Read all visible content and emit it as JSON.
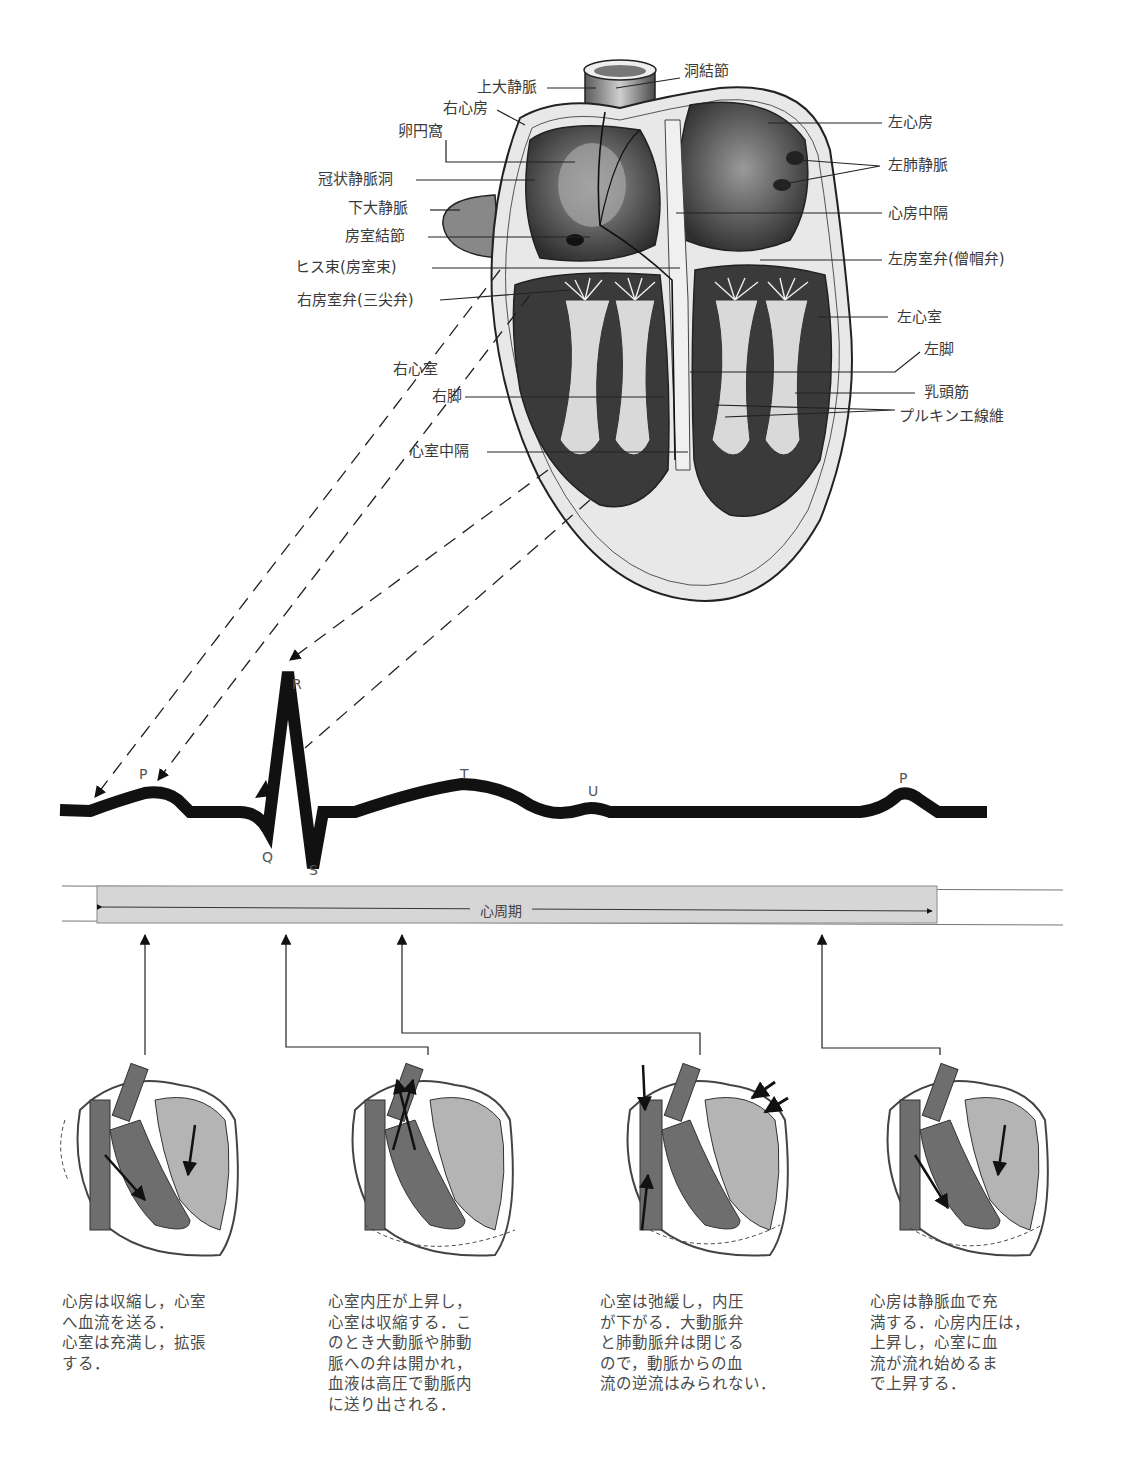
{
  "heart_diagram": {
    "labels_left": [
      {
        "id": "svc",
        "text": "上大静脈"
      },
      {
        "id": "ra",
        "text": "右心房"
      },
      {
        "id": "fossa",
        "text": "卵円窩"
      },
      {
        "id": "cs",
        "text": "冠状静脈洞"
      },
      {
        "id": "ivc",
        "text": "下大静脈"
      },
      {
        "id": "avn",
        "text": "房室結節"
      },
      {
        "id": "his",
        "text": "ヒス束(房室束)"
      },
      {
        "id": "tricuspid",
        "text": "右房室弁(三尖弁)"
      },
      {
        "id": "rv",
        "text": "右心室"
      },
      {
        "id": "rbb",
        "text": "右脚"
      },
      {
        "id": "ivs",
        "text": "心室中隔"
      }
    ],
    "labels_right": [
      {
        "id": "san",
        "text": "洞結節"
      },
      {
        "id": "la",
        "text": "左心房"
      },
      {
        "id": "lpv",
        "text": "左肺静脈"
      },
      {
        "id": "ias",
        "text": "心房中隔"
      },
      {
        "id": "mitral",
        "text": "左房室弁(僧帽弁)"
      },
      {
        "id": "lv",
        "text": "左心室"
      },
      {
        "id": "lbb",
        "text": "左脚"
      },
      {
        "id": "papillary",
        "text": "乳頭筋"
      },
      {
        "id": "purkinje",
        "text": "プルキンエ線維"
      }
    ]
  },
  "ecg": {
    "waves": {
      "p1": "P",
      "q": "Q",
      "r": "R",
      "s": "S",
      "t": "T",
      "u": "U",
      "p2": "P"
    },
    "cycle_label": "心周期"
  },
  "phases": [
    {
      "id": "atrial-systole",
      "description": "心房は収縮し，心室\nへ血流を送る．\n心室は充満し，拡張\nする．"
    },
    {
      "id": "ventricular-systole",
      "description": "心室内圧が上昇し，\n心室は収縮する．こ\nのとき大動脈や肺動\n脈への弁は開かれ，\n血液は高圧で動脈内\nに送り出される．"
    },
    {
      "id": "ventricular-relaxation",
      "description": "心室は弛緩し，内圧\nが下がる．大動脈弁\nと肺動脈弁は閉じる\nので，動脈からの血\n流の逆流はみられない．"
    },
    {
      "id": "atrial-filling",
      "description": "心房は静脈血で充\n満する．心房内圧は，\n上昇し，心室に血\n流が流れ始めるま\nで上昇する．"
    }
  ],
  "colors": {
    "ecg_trace": "#111111",
    "cycle_bar": "#d6d6d6",
    "dark_chamber": "#6e6e6e",
    "light_chamber": "#b4b4b4",
    "heart_wall": "#8a8a8a"
  }
}
